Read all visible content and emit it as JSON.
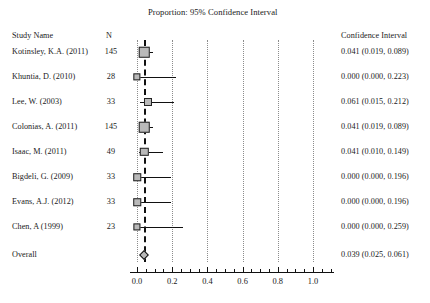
{
  "title": "Proportion: 95% Confidence Interval",
  "columns": {
    "study_name": "Study Name",
    "n": "N",
    "confidence_interval": "Confidence Interval"
  },
  "chart_data": {
    "type": "forest",
    "title": "Proportion: 95% Confidence Interval",
    "xlabel": "",
    "ylabel": "",
    "xlim": [
      -0.04,
      1.12
    ],
    "grid": true,
    "gridlines": [
      0.0,
      0.2,
      0.4,
      0.6,
      0.8,
      1.0
    ],
    "summary_line_x": 0.039,
    "xticks_major": [
      0.0,
      0.2,
      0.4,
      0.6,
      0.8,
      1.0
    ],
    "xticklabels": [
      "0.0",
      "0.2",
      "0.4",
      "0.6",
      "0.8",
      "1.0"
    ],
    "effect_measure": "Proportion",
    "rows": [
      {
        "study": "Kotinsley, K.A. (2011)",
        "n": "145",
        "estimate": 0.041,
        "lower": 0.019,
        "upper": 0.089,
        "ci_text": "0.041 (0.019, 0.089)",
        "weight": 1.0,
        "is_summary": false
      },
      {
        "study": "Khuntia, D. (2010)",
        "n": "28",
        "estimate": 0.0,
        "lower": 0.0,
        "upper": 0.223,
        "ci_text": "0.000 (0.000, 0.223)",
        "weight": 0.42,
        "is_summary": false
      },
      {
        "study": "Lee, W. (2003)",
        "n": "33",
        "estimate": 0.061,
        "lower": 0.015,
        "upper": 0.212,
        "ci_text": "0.061 (0.015, 0.212)",
        "weight": 0.55,
        "is_summary": false
      },
      {
        "study": "Colonias, A. (2011)",
        "n": "145",
        "estimate": 0.041,
        "lower": 0.019,
        "upper": 0.089,
        "ci_text": "0.041 (0.019, 0.089)",
        "weight": 1.0,
        "is_summary": false
      },
      {
        "study": "Isaac, M. (2011)",
        "n": "49",
        "estimate": 0.041,
        "lower": 0.01,
        "upper": 0.149,
        "ci_text": "0.041 (0.010, 0.149)",
        "weight": 0.62,
        "is_summary": false
      },
      {
        "study": "Bigdeli, G. (2009)",
        "n": "33",
        "estimate": 0.0,
        "lower": 0.0,
        "upper": 0.196,
        "ci_text": "0.000 (0.000, 0.196)",
        "weight": 0.46,
        "is_summary": false
      },
      {
        "study": "Evans, A.J. (2012)",
        "n": "33",
        "estimate": 0.0,
        "lower": 0.0,
        "upper": 0.196,
        "ci_text": "0.000 (0.000, 0.196)",
        "weight": 0.46,
        "is_summary": false
      },
      {
        "study": "Chen, A (1999)",
        "n": "23",
        "estimate": 0.0,
        "lower": 0.0,
        "upper": 0.259,
        "ci_text": "0.000 (0.000, 0.259)",
        "weight": 0.4,
        "is_summary": false
      },
      {
        "study": "Overall",
        "n": "",
        "estimate": 0.039,
        "lower": 0.025,
        "upper": 0.061,
        "ci_text": "0.039 (0.025, 0.061)",
        "weight": 1.0,
        "is_summary": true
      }
    ]
  },
  "colors": {
    "marker_fill": "#b9b9b9",
    "marker_edge": "#222222",
    "line": "#111111",
    "grid": "#8c8c8c",
    "text": "#1a1a1a",
    "background": "#ffffff"
  }
}
